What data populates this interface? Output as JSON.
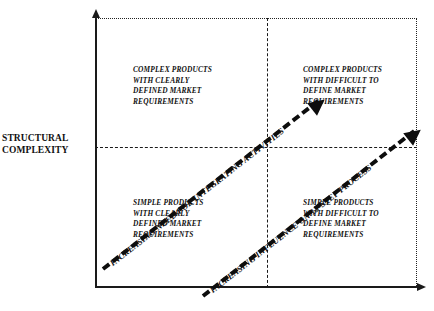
{
  "axes": {
    "y_label_lines": [
      "STRUCTURAL",
      "COMPLEXITY"
    ],
    "y_label_text": "STRUCTURAL COMPLEXITY",
    "x_label_text": ""
  },
  "quadrants": {
    "top_left": {
      "lines": [
        "COMPLEX PRODUCTS",
        "WITH CLEARLY",
        "DEFINED MARKET",
        "REQUIREMENTS"
      ]
    },
    "top_right": {
      "lines": [
        "COMPLEX PRODUCTS",
        "WITH DIFFICULT TO",
        "DEFINE MARKET",
        "REQUIREMENTS"
      ]
    },
    "bottom_left": {
      "lines": [
        "SIMPLE PRODUCTS",
        "WITH CLEARLY",
        "DEFINED MARKET",
        "REQUIREMENTS"
      ]
    },
    "bottom_right": {
      "lines": [
        "SIMPLE PRODUCTS",
        "WITH DIFFICULT TO",
        "DEFINE MARKET",
        "REQUIREMENTS"
      ]
    }
  },
  "trends": [
    {
      "label": "INCREASING NEED FOR INTEGRATING ACTIVITIES"
    },
    {
      "label": "INCREASING INFLUENCE ON 13-STEP PROCESS"
    }
  ],
  "style": {
    "ink": "#111111",
    "background": "#ffffff"
  }
}
